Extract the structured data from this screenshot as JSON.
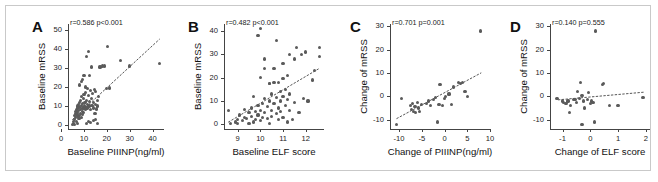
{
  "figure": {
    "background": "#ffffff",
    "border_color": "#c9c9c9",
    "dot_color": "#5a5a5a",
    "axis_color": "#444444"
  },
  "panels": [
    {
      "letter": "A",
      "stat": "r=0.586  p<0.001",
      "r": 0.586,
      "p_text": "p<0.001",
      "xlabel": "Baseline PIIINP(ng/ml)",
      "ylabel": "Baseline mRSS",
      "xticks": [
        "0",
        "10",
        "20",
        "30",
        "40"
      ],
      "yticks": [
        "0",
        "10",
        "20",
        "30",
        "40",
        "50"
      ]
    },
    {
      "letter": "B",
      "stat": "r=0.482  p<0.001",
      "r": 0.482,
      "p_text": "p<0.001",
      "xlabel": "Baseline ELF score",
      "ylabel": "Baseline mRSS",
      "xticks": [
        "9",
        "10",
        "11",
        "12"
      ],
      "yticks": [
        "0",
        "10",
        "20",
        "30",
        "40"
      ]
    },
    {
      "letter": "C",
      "stat": "r=0.701  p=0.001",
      "r": 0.701,
      "p_text": "p=0.001",
      "xlabel": "Change of PIIINP(ng/ml)",
      "ylabel": "Change of mRSS",
      "xticks": [
        "-10",
        "-5",
        "0",
        "5",
        "10"
      ],
      "yticks": [
        "-10",
        "0",
        "10",
        "20",
        "30"
      ]
    },
    {
      "letter": "D",
      "stat": "r=0.140  p=0.555",
      "r": 0.14,
      "p_text": "p=0.555",
      "xlabel": "Change of ELF score",
      "ylabel": "Change of mRSS",
      "xticks": [
        "-1",
        "0",
        "1",
        "2"
      ],
      "yticks": [
        "-10",
        "0",
        "10",
        "20",
        "30"
      ]
    }
  ],
  "chart_data": [
    {
      "type": "scatter",
      "panel": "A",
      "title": "",
      "xlabel": "Baseline PIIINP(ng/ml)",
      "ylabel": "Baseline mRSS",
      "xlim": [
        3,
        45
      ],
      "ylim": [
        -2,
        53
      ],
      "xticks": [
        0,
        10,
        20,
        30,
        40
      ],
      "yticks": [
        0,
        10,
        20,
        30,
        40,
        50
      ],
      "grid": false,
      "legend": "none",
      "annotation": "r=0.586  p<0.001",
      "correlation_r": 0.586,
      "p_value_text": "p<0.001",
      "trendline": {
        "type": "dotted-linear",
        "x0": 5.0,
        "y0": 3.0,
        "x1": 43.0,
        "y1": 45.0
      },
      "points": [
        [
          5.0,
          0.5
        ],
        [
          5.3,
          1.0
        ],
        [
          5.5,
          2.0
        ],
        [
          5.8,
          0.5
        ],
        [
          6.0,
          3.0
        ],
        [
          6.0,
          5.0
        ],
        [
          6.2,
          6.0
        ],
        [
          6.3,
          4.0
        ],
        [
          6.5,
          7.0
        ],
        [
          6.6,
          2.0
        ],
        [
          6.8,
          8.0
        ],
        [
          6.9,
          5.5
        ],
        [
          7.0,
          1.0
        ],
        [
          7.0,
          9.0
        ],
        [
          7.2,
          6.5
        ],
        [
          7.3,
          10.0
        ],
        [
          7.4,
          4.5
        ],
        [
          7.5,
          11.0
        ],
        [
          7.6,
          7.5
        ],
        [
          7.8,
          3.5
        ],
        [
          7.9,
          12.0
        ],
        [
          8.0,
          5.0
        ],
        [
          8.0,
          21.0
        ],
        [
          8.2,
          9.5
        ],
        [
          8.3,
          6.0
        ],
        [
          8.5,
          13.0
        ],
        [
          8.6,
          8.0
        ],
        [
          8.8,
          10.5
        ],
        [
          8.9,
          4.0
        ],
        [
          9.0,
          15.0
        ],
        [
          9.0,
          23.0
        ],
        [
          9.2,
          7.0
        ],
        [
          9.3,
          11.5
        ],
        [
          9.4,
          5.5
        ],
        [
          9.5,
          24.0
        ],
        [
          9.6,
          9.0
        ],
        [
          9.8,
          14.0
        ],
        [
          9.9,
          6.5
        ],
        [
          10.0,
          16.0
        ],
        [
          10.0,
          26.0
        ],
        [
          10.2,
          10.0
        ],
        [
          10.4,
          12.0
        ],
        [
          10.5,
          20.0
        ],
        [
          10.6,
          8.5
        ],
        [
          10.8,
          17.0
        ],
        [
          11.0,
          1.0
        ],
        [
          11.0,
          13.0
        ],
        [
          11.2,
          36.0
        ],
        [
          11.3,
          9.0
        ],
        [
          11.5,
          19.0
        ],
        [
          11.6,
          11.0
        ],
        [
          11.8,
          38.5
        ],
        [
          12.0,
          2.0
        ],
        [
          12.0,
          15.5
        ],
        [
          12.2,
          10.0
        ],
        [
          12.4,
          26.0
        ],
        [
          12.5,
          12.5
        ],
        [
          12.8,
          18.0
        ],
        [
          13.0,
          1.5
        ],
        [
          13.0,
          8.0
        ],
        [
          13.2,
          14.0
        ],
        [
          13.4,
          30.5
        ],
        [
          13.5,
          10.5
        ],
        [
          13.8,
          16.5
        ],
        [
          14.0,
          2.5
        ],
        [
          14.0,
          12.0
        ],
        [
          14.2,
          9.0
        ],
        [
          14.5,
          18.5
        ],
        [
          14.8,
          6.0
        ],
        [
          15.0,
          3.0
        ],
        [
          15.0,
          11.0
        ],
        [
          15.2,
          17.5
        ],
        [
          15.5,
          8.5
        ],
        [
          15.8,
          13.0
        ],
        [
          16.0,
          1.0
        ],
        [
          16.0,
          10.0
        ],
        [
          16.3,
          15.0
        ],
        [
          17.0,
          30.5
        ],
        [
          18.0,
          31.0
        ],
        [
          19.0,
          31.0
        ],
        [
          20.0,
          19.0
        ],
        [
          20.3,
          41.0
        ],
        [
          21.0,
          19.5
        ],
        [
          26.0,
          34.0
        ],
        [
          30.0,
          31.0
        ],
        [
          43.0,
          32.5
        ]
      ]
    },
    {
      "type": "scatter",
      "panel": "B",
      "title": "",
      "xlabel": "Baseline ELF score",
      "ylabel": "Baseline mRSS",
      "xlim": [
        8.4,
        12.8
      ],
      "ylim": [
        -2,
        43
      ],
      "xticks": [
        9,
        10,
        11,
        12
      ],
      "yticks": [
        0,
        10,
        20,
        30,
        40
      ],
      "grid": false,
      "legend": "none",
      "annotation": "r=0.482  p<0.001",
      "correlation_r": 0.482,
      "p_value_text": "p<0.001",
      "trendline": {
        "type": "dotted-linear",
        "x0": 8.6,
        "y0": 1.0,
        "x1": 12.6,
        "y1": 24.0
      },
      "points": [
        [
          8.6,
          6.0
        ],
        [
          8.7,
          0.5
        ],
        [
          8.9,
          1.0
        ],
        [
          9.0,
          2.0
        ],
        [
          9.0,
          0.5
        ],
        [
          9.1,
          4.0
        ],
        [
          9.2,
          1.5
        ],
        [
          9.3,
          3.0
        ],
        [
          9.3,
          6.5
        ],
        [
          9.4,
          2.5
        ],
        [
          9.5,
          5.0
        ],
        [
          9.5,
          0.5
        ],
        [
          9.6,
          7.0
        ],
        [
          9.6,
          3.5
        ],
        [
          9.7,
          12.0
        ],
        [
          9.7,
          1.0
        ],
        [
          9.8,
          5.5
        ],
        [
          9.8,
          2.0
        ],
        [
          9.9,
          8.0
        ],
        [
          9.9,
          38.0
        ],
        [
          9.9,
          4.0
        ],
        [
          10.0,
          20.0
        ],
        [
          10.0,
          6.0
        ],
        [
          10.0,
          1.5
        ],
        [
          10.0,
          41.0
        ],
        [
          10.1,
          9.0
        ],
        [
          10.1,
          3.0
        ],
        [
          10.2,
          24.0
        ],
        [
          10.2,
          28.0
        ],
        [
          10.2,
          11.0
        ],
        [
          10.2,
          5.0
        ],
        [
          10.3,
          7.5
        ],
        [
          10.3,
          2.5
        ],
        [
          10.4,
          17.5
        ],
        [
          10.4,
          17.5
        ],
        [
          10.4,
          10.0
        ],
        [
          10.4,
          0.5
        ],
        [
          10.5,
          13.0
        ],
        [
          10.5,
          6.0
        ],
        [
          10.5,
          3.5
        ],
        [
          10.6,
          18.0
        ],
        [
          10.6,
          9.0
        ],
        [
          10.6,
          24.0
        ],
        [
          10.7,
          11.5
        ],
        [
          10.7,
          4.5
        ],
        [
          10.7,
          36.0
        ],
        [
          10.8,
          18.0
        ],
        [
          10.8,
          7.0
        ],
        [
          10.8,
          2.0
        ],
        [
          10.9,
          14.0
        ],
        [
          10.9,
          10.0
        ],
        [
          10.9,
          5.5
        ],
        [
          11.0,
          19.5
        ],
        [
          11.0,
          12.0
        ],
        [
          11.0,
          3.0
        ],
        [
          11.0,
          26.0
        ],
        [
          11.1,
          8.0
        ],
        [
          11.1,
          15.0
        ],
        [
          11.2,
          21.0
        ],
        [
          11.2,
          10.5
        ],
        [
          11.2,
          1.0
        ],
        [
          11.3,
          30.0
        ],
        [
          11.3,
          6.0
        ],
        [
          11.3,
          13.0
        ],
        [
          11.4,
          2.0
        ],
        [
          11.5,
          28.0
        ],
        [
          11.5,
          9.5
        ],
        [
          11.6,
          33.0
        ],
        [
          11.7,
          5.0
        ],
        [
          11.8,
          30.0
        ],
        [
          11.9,
          11.0
        ],
        [
          12.0,
          31.0
        ],
        [
          12.1,
          10.0
        ],
        [
          12.3,
          19.0
        ],
        [
          12.4,
          23.0
        ],
        [
          12.6,
          33.0
        ],
        [
          12.6,
          29.0
        ]
      ]
    },
    {
      "type": "scatter",
      "panel": "C",
      "title": "",
      "xlabel": "Change of PIIINP(ng/ml)",
      "ylabel": "Change of mRSS",
      "xlim": [
        -12,
        10
      ],
      "ylim": [
        -14,
        31
      ],
      "xticks": [
        -10,
        -5,
        0,
        5,
        10
      ],
      "yticks": [
        -10,
        0,
        10,
        20,
        30
      ],
      "grid": false,
      "legend": "none",
      "annotation": "r=0.701  p=0.001",
      "correlation_r": 0.701,
      "p_value_text": "p=0.001",
      "trendline": {
        "type": "dotted-linear",
        "x0": -10.5,
        "y0": -9.5,
        "x1": 8.0,
        "y1": 10.0
      },
      "points": [
        [
          -10.5,
          -12.0
        ],
        [
          -9.5,
          -1.0
        ],
        [
          -7.5,
          -4.0
        ],
        [
          -7.2,
          -5.5
        ],
        [
          -7.0,
          -3.0
        ],
        [
          -6.8,
          -6.5
        ],
        [
          -6.5,
          -4.5
        ],
        [
          -6.3,
          -7.0
        ],
        [
          -6.0,
          -2.5
        ],
        [
          -5.8,
          -5.0
        ],
        [
          -5.5,
          -6.5
        ],
        [
          -5.0,
          -3.5
        ],
        [
          -4.0,
          -3.0
        ],
        [
          -3.5,
          -2.0
        ],
        [
          -3.0,
          -4.0
        ],
        [
          -2.5,
          -1.5
        ],
        [
          -2.0,
          -0.5
        ],
        [
          -1.5,
          -11.0
        ],
        [
          -1.2,
          -3.5
        ],
        [
          -1.0,
          5.0
        ],
        [
          -0.5,
          -4.0
        ],
        [
          0.0,
          -1.0
        ],
        [
          0.3,
          0.0
        ],
        [
          1.0,
          1.0
        ],
        [
          1.5,
          -3.5
        ],
        [
          2.0,
          4.0
        ],
        [
          3.0,
          6.0
        ],
        [
          3.5,
          5.5
        ],
        [
          4.0,
          6.0
        ],
        [
          4.5,
          2.0
        ],
        [
          5.0,
          0.0
        ],
        [
          8.0,
          28.0
        ]
      ]
    },
    {
      "type": "scatter",
      "panel": "D",
      "title": "",
      "xlabel": "Change of ELF score",
      "ylabel": "Change of mRSS",
      "xlim": [
        -1.45,
        2.15
      ],
      "ylim": [
        -14,
        31
      ],
      "xticks": [
        -1,
        0,
        1,
        2
      ],
      "yticks": [
        -10,
        0,
        10,
        20,
        30
      ],
      "grid": false,
      "legend": "none",
      "annotation": "r=0.140  p=0.555",
      "correlation_r": 0.14,
      "p_value_text": "p=0.555",
      "trendline": {
        "type": "dotted-linear",
        "x0": -1.15,
        "y0": -1.5,
        "x1": 1.95,
        "y1": 1.8
      },
      "points": [
        [
          -1.2,
          -1.0
        ],
        [
          -1.0,
          -2.0
        ],
        [
          -0.95,
          -2.5
        ],
        [
          -0.9,
          -3.0
        ],
        [
          -0.85,
          -3.0
        ],
        [
          -0.8,
          -2.0
        ],
        [
          -0.75,
          -7.0
        ],
        [
          -0.7,
          -4.0
        ],
        [
          -0.6,
          -1.5
        ],
        [
          -0.55,
          -1.5
        ],
        [
          -0.5,
          -2.5
        ],
        [
          -0.45,
          2.0
        ],
        [
          -0.4,
          -1.0
        ],
        [
          -0.35,
          6.0
        ],
        [
          -0.3,
          0.5
        ],
        [
          -0.3,
          -12.0
        ],
        [
          -0.25,
          -2.0
        ],
        [
          -0.2,
          -5.0
        ],
        [
          -0.1,
          -1.5
        ],
        [
          -0.05,
          1.5
        ],
        [
          0.0,
          -3.0
        ],
        [
          0.05,
          -2.0
        ],
        [
          0.1,
          -2.5
        ],
        [
          0.15,
          -11.0
        ],
        [
          0.2,
          28.0
        ],
        [
          0.45,
          5.0
        ],
        [
          0.48,
          5.5
        ],
        [
          0.7,
          -4.0
        ],
        [
          1.0,
          -4.0
        ],
        [
          1.9,
          -0.5
        ]
      ]
    }
  ]
}
